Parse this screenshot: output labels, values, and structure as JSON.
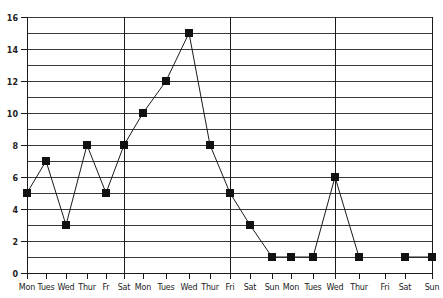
{
  "chart_data": {
    "type": "line",
    "title": "",
    "xlabel": "",
    "ylabel": "",
    "ylim": [
      0,
      16
    ],
    "grid": true,
    "grid_step": 1,
    "legend": null,
    "y_ticks": [
      "0",
      "2",
      "4",
      "6",
      "8",
      "10",
      "12",
      "14",
      "16"
    ],
    "categories": [
      "Mon",
      "Tues",
      "Wed",
      "Thur",
      "Fr",
      "Sat",
      "Mon",
      "Tues",
      "Wed",
      "Thur",
      "Fri",
      "Sat",
      "Sun",
      "Mon",
      "Tues",
      "Wed",
      "Thur",
      "Fri",
      "Sat",
      "Sun"
    ],
    "series": [
      {
        "name": "series-1",
        "marker": "square",
        "color": "#111111",
        "values": [
          5,
          7,
          3,
          8,
          5,
          8,
          10,
          12,
          15,
          8,
          5,
          3,
          1,
          1,
          1,
          6,
          1,
          null,
          1,
          1
        ]
      }
    ],
    "vertical_separators_at_index": [
      5,
      10,
      15,
      19
    ]
  }
}
